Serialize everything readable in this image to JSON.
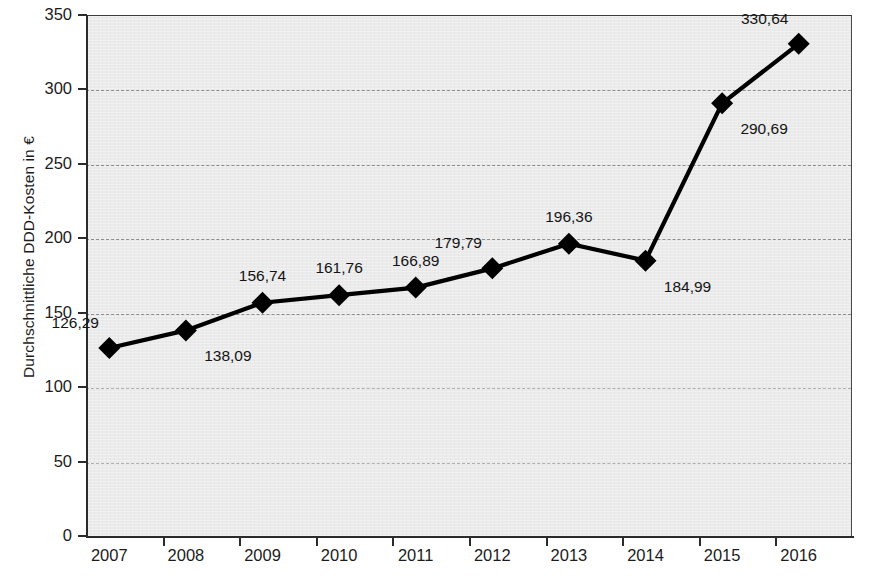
{
  "chart_data": {
    "type": "line",
    "title": "",
    "xlabel": "",
    "ylabel": "Durchschnittliche DDD-Kosten in €",
    "categories": [
      "2007",
      "2008",
      "2009",
      "2010",
      "2011",
      "2012",
      "2013",
      "2014",
      "2015",
      "2016"
    ],
    "values": [
      126.29,
      138.09,
      156.74,
      161.76,
      166.89,
      179.79,
      196.36,
      184.99,
      290.69,
      330.64
    ],
    "value_labels": [
      "126,29",
      "138,09",
      "156,74",
      "161,76",
      "166,89",
      "179,79",
      "196,36",
      "184,99",
      "290,69",
      "330,64"
    ],
    "ylim": [
      0,
      350
    ],
    "y_ticks": [
      0,
      50,
      100,
      150,
      200,
      250,
      300,
      350
    ],
    "y_tick_labels": [
      "0",
      "50",
      "100",
      "150",
      "200",
      "250",
      "300",
      "350"
    ],
    "grid": true,
    "grid_axis": "y",
    "legend": false,
    "legend_position": "none",
    "marker": "diamond",
    "series_color": "#000000",
    "plot_background": "#ebebeb",
    "gridline_color": "#8d8d8d",
    "label_placements": [
      "above-left",
      "below-right",
      "above",
      "above",
      "above",
      "above-left",
      "above",
      "below-right",
      "below-right",
      "above-left"
    ]
  }
}
